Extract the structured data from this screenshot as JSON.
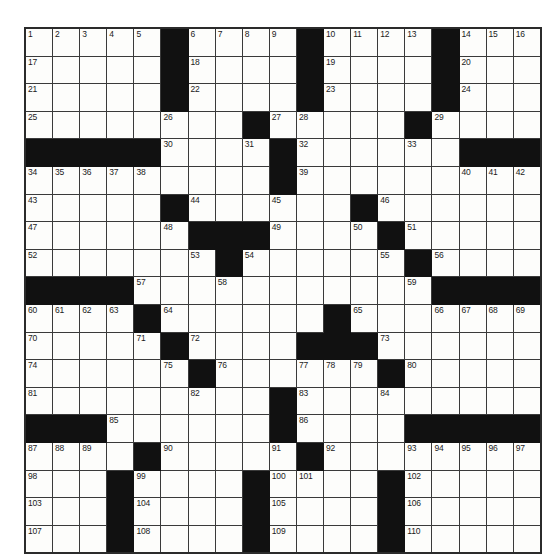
{
  "puzzle": {
    "title": "Crossword Grid",
    "rows": 19,
    "cols": 17,
    "colors": {
      "block": "#111111",
      "cell": "#fdfdfb",
      "grid_line": "#3a3a3a",
      "border": "#2b2b2b",
      "number_text": "#1a1a1a",
      "page_background": "#ffffff"
    },
    "cell_size_px": 28.8,
    "max_clue_number": 110,
    "grid": [
      [
        "1",
        "2",
        "3",
        "4",
        "5",
        "#",
        "6",
        "7",
        "8",
        "9",
        "#",
        "10",
        "11",
        "12",
        "13",
        "#",
        "14",
        "15",
        "16"
      ],
      [
        "17",
        "",
        "",
        "",
        "",
        "#",
        "18",
        "",
        "",
        "",
        "#",
        "19",
        "",
        "",
        "",
        "#",
        "20",
        "",
        ""
      ],
      [
        "21",
        "",
        "",
        "",
        "",
        "#",
        "22",
        "",
        "",
        "",
        "#",
        "23",
        "",
        "",
        "",
        "#",
        "24",
        "",
        ""
      ],
      [
        "25",
        "",
        "",
        "",
        "",
        "26",
        "",
        "",
        "#",
        "27",
        "28",
        "",
        "",
        "",
        "#",
        "29",
        "",
        "",
        ""
      ],
      [
        "#",
        "#",
        "#",
        "#",
        "#",
        "30",
        "",
        "",
        "31",
        "#",
        "32",
        "",
        "",
        "",
        "33",
        "",
        "#",
        "#",
        "#"
      ],
      [
        "34",
        "35",
        "36",
        "37",
        "38",
        "",
        "",
        "",
        "",
        "#",
        "39",
        "",
        "",
        "",
        "",
        "",
        "40",
        "41",
        "42"
      ],
      [
        "43",
        "",
        "",
        "",
        "",
        "#",
        "44",
        "",
        "",
        "45",
        "",
        "",
        "#",
        "46",
        "",
        "",
        "",
        "",
        ""
      ],
      [
        "47",
        "",
        "",
        "",
        "",
        "48",
        "#",
        "#",
        "#",
        "49",
        "",
        "",
        "50",
        "#",
        "51",
        "",
        "",
        "",
        ""
      ],
      [
        "52",
        "",
        "",
        "",
        "",
        "",
        "53",
        "#",
        "54",
        "",
        "",
        "",
        "",
        "55",
        "#",
        "56",
        "",
        "",
        ""
      ],
      [
        "#",
        "#",
        "#",
        "#",
        "57",
        "",
        "",
        "58",
        "",
        "",
        "",
        "",
        "",
        "",
        "59",
        "#",
        "#",
        "#",
        "#"
      ],
      [
        "60",
        "61",
        "62",
        "63",
        "#",
        "64",
        "",
        "",
        "",
        "",
        "",
        "#",
        "65",
        "",
        "",
        "66",
        "67",
        "68",
        "69"
      ],
      [
        "70",
        "",
        "",
        "",
        "71",
        "#",
        "72",
        "",
        "",
        "",
        "#",
        "#",
        "#",
        "73",
        "",
        "",
        "",
        "",
        ""
      ],
      [
        "74",
        "",
        "",
        "",
        "",
        "75",
        "#",
        "76",
        "",
        "",
        "77",
        "78",
        "79",
        "#",
        "80",
        "",
        "",
        "",
        ""
      ],
      [
        "81",
        "",
        "",
        "",
        "",
        "",
        "82",
        "",
        "",
        "#",
        "83",
        "",
        "",
        "84",
        "",
        "",
        "",
        "",
        ""
      ],
      [
        "#",
        "#",
        "#",
        "85",
        "",
        "",
        "",
        "",
        "",
        "#",
        "86",
        "",
        "",
        "",
        "#",
        "#",
        "#",
        "#",
        "#"
      ],
      [
        "87",
        "88",
        "89",
        "",
        "#",
        "90",
        "",
        "",
        "",
        "91",
        "#",
        "92",
        "",
        "",
        "93",
        "94",
        "95",
        "96",
        "97"
      ],
      [
        "98",
        "",
        "",
        "#",
        "99",
        "",
        "",
        "",
        "#",
        "100",
        "101",
        "",
        "",
        "#",
        "102",
        "",
        "",
        "",
        ""
      ],
      [
        "103",
        "",
        "",
        "#",
        "104",
        "",
        "",
        "",
        "#",
        "105",
        "",
        "",
        "",
        "#",
        "106",
        "",
        "",
        "",
        ""
      ],
      [
        "107",
        "",
        "",
        "#",
        "108",
        "",
        "",
        "",
        "#",
        "109",
        "",
        "",
        "",
        "#",
        "110",
        "",
        "",
        "",
        ""
      ]
    ]
  }
}
